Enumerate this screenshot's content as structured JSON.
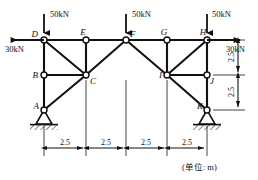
{
  "figure": {
    "type": "structural-truss-frame-diagram",
    "unit_note": "(单位: m)",
    "background_color": "#ffffff",
    "line_color": "#111111"
  },
  "nodes": [
    {
      "id": "A",
      "label": "A",
      "x": 44,
      "y": 110,
      "kind": "pin-support",
      "label_dx": -9,
      "label_dy": -2
    },
    {
      "id": "B",
      "label": "B",
      "x": 44,
      "y": 75,
      "kind": "joint",
      "label_dx": -9,
      "label_dy": 2
    },
    {
      "id": "C",
      "label": "C",
      "x": 86,
      "y": 75,
      "kind": "joint",
      "label_dx": 4,
      "label_dy": 8
    },
    {
      "id": "D",
      "label": "D",
      "x": 44,
      "y": 40,
      "kind": "joint",
      "label_dx": -9,
      "label_dy": -3
    },
    {
      "id": "E",
      "label": "E",
      "x": 86,
      "y": 40,
      "kind": "joint",
      "label_dx": -3,
      "label_dy": -4
    },
    {
      "id": "F",
      "label": "F",
      "x": 126,
      "y": 40,
      "kind": "joint",
      "label_dx": 4,
      "label_dy": -3
    },
    {
      "id": "G",
      "label": "G",
      "x": 167,
      "y": 40,
      "kind": "joint",
      "label_dx": -4,
      "label_dy": -4
    },
    {
      "id": "H",
      "label": "H",
      "x": 207,
      "y": 40,
      "kind": "joint",
      "label_dx": -4,
      "label_dy": -4
    },
    {
      "id": "I",
      "label": "I",
      "x": 167,
      "y": 75,
      "kind": "joint",
      "label_dx": -8,
      "label_dy": 2
    },
    {
      "id": "J",
      "label": "J",
      "x": 207,
      "y": 75,
      "kind": "joint",
      "label_dx": 3,
      "label_dy": 8
    },
    {
      "id": "K",
      "label": "K",
      "x": 207,
      "y": 110,
      "kind": "pin-support",
      "label_dx": -9,
      "label_dy": -2
    }
  ],
  "members": [
    {
      "from": "D",
      "to": "E",
      "weight": "thick"
    },
    {
      "from": "E",
      "to": "F",
      "weight": "thick"
    },
    {
      "from": "F",
      "to": "G",
      "weight": "thick"
    },
    {
      "from": "G",
      "to": "H",
      "weight": "thick"
    },
    {
      "from": "B",
      "to": "C",
      "weight": "thick"
    },
    {
      "from": "I",
      "to": "J",
      "weight": "thick"
    },
    {
      "from": "D",
      "to": "B",
      "weight": "thick"
    },
    {
      "from": "B",
      "to": "A",
      "weight": "thick"
    },
    {
      "from": "E",
      "to": "C",
      "weight": "thick"
    },
    {
      "from": "G",
      "to": "I",
      "weight": "thick"
    },
    {
      "from": "H",
      "to": "J",
      "weight": "thick"
    },
    {
      "from": "J",
      "to": "K",
      "weight": "thick"
    },
    {
      "from": "D",
      "to": "C",
      "weight": "thick"
    },
    {
      "from": "A",
      "to": "C",
      "weight": "thick"
    },
    {
      "from": "C",
      "to": "F",
      "weight": "thick"
    },
    {
      "from": "F",
      "to": "I",
      "weight": "thick"
    },
    {
      "from": "H",
      "to": "I",
      "weight": "thick"
    },
    {
      "from": "I",
      "to": "K",
      "weight": "thick"
    }
  ],
  "loads": [
    {
      "id": "load-D",
      "label": "50kN",
      "direction": "down",
      "x": 44,
      "tip_y": 40,
      "tail_y": 14,
      "label_x": 52,
      "label_y": 14
    },
    {
      "id": "load-F",
      "label": "50kN",
      "direction": "down",
      "x": 126,
      "tip_y": 40,
      "tail_y": 14,
      "label_x": 134,
      "label_y": 14
    },
    {
      "id": "load-H",
      "label": "50kN",
      "direction": "down",
      "x": 207,
      "tip_y": 40,
      "tail_y": 14,
      "label_x": 214,
      "label_y": 14
    },
    {
      "id": "load-left-30",
      "label": "30kN",
      "direction": "left",
      "y": 40,
      "tip_x": 4,
      "tail_x": 44,
      "label_x": 12,
      "label_y": 51
    },
    {
      "id": "load-right-30",
      "label": "30kN",
      "direction": "right",
      "y": 40,
      "tip_x": 247,
      "tail_x": 207,
      "label_x": 228,
      "label_y": 51
    }
  ],
  "supports": [
    {
      "id": "support-A",
      "x": 44,
      "y": 110,
      "type": "pin-hatched"
    },
    {
      "id": "support-K",
      "x": 207,
      "y": 110,
      "type": "pin-hatched"
    }
  ],
  "horizontal_dimensions": {
    "baseline_y": 148,
    "tick_top_y": 80,
    "segments": [
      {
        "label": "2.5",
        "x_from": 44,
        "x_to": 86
      },
      {
        "label": "2.5",
        "x_from": 86,
        "x_to": 126
      },
      {
        "label": "2.5",
        "x_from": 126,
        "x_to": 167
      },
      {
        "label": "2.5",
        "x_from": 167,
        "x_to": 207
      }
    ]
  },
  "vertical_dimensions": {
    "line_x": 238,
    "segments": [
      {
        "label": "2.5",
        "y_from": 40,
        "y_to": 75
      },
      {
        "label": "2.5",
        "y_from": 75,
        "y_to": 110
      }
    ]
  },
  "unit_text": {
    "text": "(单位: m)",
    "x": 182,
    "y": 170
  }
}
